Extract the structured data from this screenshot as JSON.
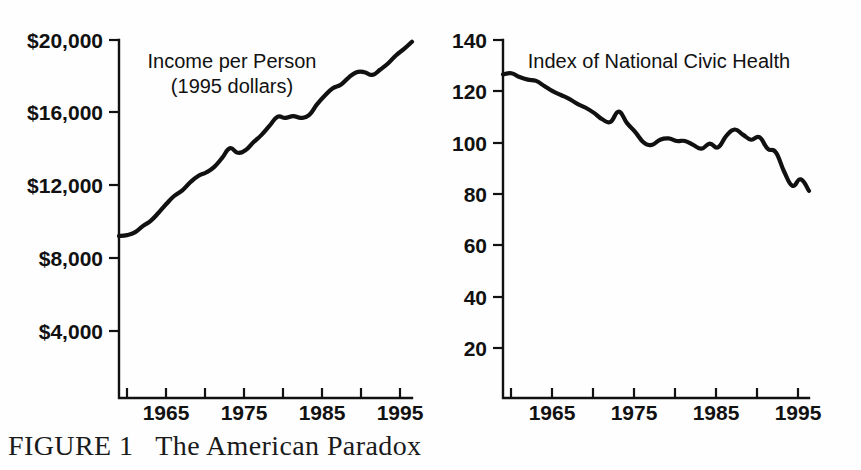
{
  "figure": {
    "caption_label": "FIGURE 1",
    "caption_text": "The American Paradox"
  },
  "chart_data": [
    {
      "type": "line",
      "id": "income-per-person",
      "title": "Income per Person",
      "subtitle": "(1995 dollars)",
      "xlabel": "",
      "ylabel": "",
      "xlim": [
        1959,
        1996
      ],
      "ylim": [
        0,
        20000
      ],
      "grid": false,
      "legend": "none",
      "y_ticks": [
        4000,
        8000,
        12000,
        16000,
        20000
      ],
      "y_tick_labels": [
        "$4,000",
        "$8,000",
        "$12,000",
        "$16,000",
        "$20,000"
      ],
      "x_ticks": [
        1960,
        1965,
        1970,
        1975,
        1980,
        1985,
        1990,
        1995
      ],
      "x_tick_labels": [
        "",
        "1965",
        "",
        "1975",
        "",
        "1985",
        "",
        "1995"
      ],
      "x": [
        1959,
        1960,
        1961,
        1962,
        1963,
        1964,
        1965,
        1966,
        1967,
        1968,
        1969,
        1970,
        1971,
        1972,
        1973,
        1974,
        1975,
        1976,
        1977,
        1978,
        1979,
        1980,
        1981,
        1982,
        1983,
        1984,
        1985,
        1986,
        1987,
        1988,
        1989,
        1990,
        1991,
        1992,
        1993,
        1994,
        1995,
        1996
      ],
      "values": [
        9050,
        9100,
        9250,
        9600,
        9900,
        10350,
        10850,
        11300,
        11600,
        12050,
        12400,
        12600,
        12900,
        13400,
        13950,
        13700,
        13850,
        14300,
        14700,
        15200,
        15700,
        15650,
        15750,
        15650,
        15800,
        16400,
        16900,
        17300,
        17500,
        17900,
        18200,
        18200,
        18050,
        18350,
        18700,
        19150,
        19500,
        19900
      ]
    },
    {
      "type": "line",
      "id": "index-of-national-civic-health",
      "title": "Index of National Civic Health",
      "subtitle": "",
      "xlabel": "",
      "ylabel": "",
      "xlim": [
        1959,
        1996
      ],
      "ylim": [
        0,
        140
      ],
      "grid": false,
      "legend": "none",
      "y_ticks": [
        20,
        40,
        60,
        80,
        100,
        120,
        140
      ],
      "y_tick_labels": [
        "20",
        "40",
        "60",
        "80",
        "100",
        "120",
        "140"
      ],
      "x_ticks": [
        1960,
        1965,
        1970,
        1975,
        1980,
        1985,
        1990,
        1995
      ],
      "x_tick_labels": [
        "",
        "1965",
        "",
        "1975",
        "",
        "1985",
        "",
        "1995"
      ],
      "x": [
        1959,
        1960,
        1961,
        1962,
        1963,
        1964,
        1965,
        1966,
        1967,
        1968,
        1969,
        1970,
        1971,
        1972,
        1973,
        1974,
        1975,
        1976,
        1977,
        1978,
        1979,
        1980,
        1981,
        1982,
        1983,
        1984,
        1985,
        1986,
        1987,
        1988,
        1989,
        1990,
        1991,
        1992,
        1993,
        1994,
        1995,
        1996
      ],
      "values": [
        126.5,
        127.0,
        125.5,
        124.5,
        124.0,
        122.0,
        120.0,
        118.5,
        117.0,
        115.0,
        113.5,
        111.5,
        109.0,
        108.0,
        112.0,
        107.5,
        104.0,
        100.0,
        99.0,
        101.0,
        101.5,
        100.5,
        100.5,
        99.0,
        97.5,
        99.5,
        98.0,
        102.5,
        105.0,
        103.0,
        101.0,
        102.0,
        97.5,
        96.0,
        88.5,
        83.0,
        85.5,
        81.0,
        83.5
      ]
    }
  ]
}
